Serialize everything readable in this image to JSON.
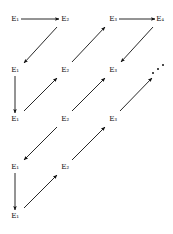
{
  "figure": {
    "type": "commutative-diagram",
    "caption": "",
    "background_color": "#ffffff",
    "ink_color": "#111111",
    "width": 173,
    "height": 234
  },
  "nodes": [
    {
      "id": "n-r1-c1",
      "label": "E₁",
      "row": 1,
      "col": 1,
      "x": 15,
      "y": 19
    },
    {
      "id": "n-r1-c2",
      "label": "E₂",
      "row": 1,
      "col": 2,
      "x": 65,
      "y": 19
    },
    {
      "id": "n-r1-c3",
      "label": "E₃",
      "row": 1,
      "col": 3,
      "x": 113,
      "y": 19
    },
    {
      "id": "n-r1-c4",
      "label": "E₄",
      "row": 1,
      "col": 4,
      "x": 160,
      "y": 19
    },
    {
      "id": "n-r2-c1",
      "label": "E₁",
      "row": 2,
      "col": 1,
      "x": 15,
      "y": 70
    },
    {
      "id": "n-r2-c2",
      "label": "E₂",
      "row": 2,
      "col": 2,
      "x": 65,
      "y": 70
    },
    {
      "id": "n-r2-c3",
      "label": "E₃",
      "row": 2,
      "col": 3,
      "x": 113,
      "y": 70
    },
    {
      "id": "n-r3-c1",
      "label": "E₁",
      "row": 3,
      "col": 1,
      "x": 15,
      "y": 119
    },
    {
      "id": "n-r3-c2",
      "label": "E₂",
      "row": 3,
      "col": 2,
      "x": 65,
      "y": 119
    },
    {
      "id": "n-r3-c3",
      "label": "E₃",
      "row": 3,
      "col": 3,
      "x": 113,
      "y": 119
    },
    {
      "id": "n-r4-c1",
      "label": "E₁",
      "row": 4,
      "col": 1,
      "x": 15,
      "y": 167
    },
    {
      "id": "n-r4-c2",
      "label": "E₂",
      "row": 4,
      "col": 2,
      "x": 65,
      "y": 167
    },
    {
      "id": "n-r5-c1",
      "label": "E₁",
      "row": 5,
      "col": 1,
      "x": 15,
      "y": 216
    }
  ],
  "arrows": [
    {
      "id": "a-h-r1-c1-c2",
      "kind": "horizontal",
      "from": "n-r1-c1",
      "to": "n-r1-c2",
      "x1": 21,
      "y1": 19,
      "x2": 59,
      "y2": 19,
      "label": ""
    },
    {
      "id": "a-h-r1-c3-c4",
      "kind": "horizontal",
      "from": "n-r1-c3",
      "to": "n-r1-c4",
      "x1": 119,
      "y1": 19,
      "x2": 155,
      "y2": 19,
      "label": ""
    },
    {
      "id": "a-v-c1-r2-r3",
      "kind": "vertical",
      "from": "n-r2-c1",
      "to": "n-r3-c1",
      "x1": 15,
      "y1": 76,
      "x2": 15,
      "y2": 113,
      "label": ""
    },
    {
      "id": "a-v-c1-r4-r5",
      "kind": "vertical",
      "from": "n-r4-c1",
      "to": "n-r5-c1",
      "x1": 15,
      "y1": 173,
      "x2": 15,
      "y2": 210,
      "label": ""
    },
    {
      "id": "a-d-r1c2-to-r2c1",
      "kind": "diagonal-down-left",
      "from": "n-r1-c2",
      "to": "n-r2-c1",
      "x1": 57,
      "y1": 27,
      "x2": 24,
      "y2": 63,
      "label": ""
    },
    {
      "id": "a-d-r2c2-to-r1c3",
      "kind": "diagonal-up-right",
      "from": "n-r2-c2",
      "to": "n-r1-c3",
      "x1": 72,
      "y1": 62,
      "x2": 105,
      "y2": 27,
      "label": ""
    },
    {
      "id": "a-d-r1c4-to-r2c3",
      "kind": "diagonal-down-left",
      "from": "n-r1-c4",
      "to": "n-r2-c3",
      "x1": 153,
      "y1": 27,
      "x2": 121,
      "y2": 62,
      "label": ""
    },
    {
      "id": "a-d-r3c1-to-r2c2",
      "kind": "diagonal-up-right",
      "from": "n-r3-c1",
      "to": "n-r2-c2",
      "x1": 24,
      "y1": 111,
      "x2": 57,
      "y2": 78,
      "label": ""
    },
    {
      "id": "a-d-r3c2-to-r2c3",
      "kind": "diagonal-up-right",
      "from": "n-r3-c2",
      "to": "n-r2-c3",
      "x1": 72,
      "y1": 111,
      "x2": 105,
      "y2": 78,
      "label": ""
    },
    {
      "id": "a-d-r3c3-to-ellipsis",
      "kind": "diagonal-up-right",
      "from": "n-r3-c3",
      "to": "ellipsis-top-right",
      "x1": 120,
      "y1": 111,
      "x2": 152,
      "y2": 78,
      "label": ""
    },
    {
      "id": "a-d-r3c2-to-r4c1",
      "kind": "diagonal-down-left",
      "from": "n-r3-c2",
      "to": "n-r4-c1",
      "x1": 57,
      "y1": 127,
      "x2": 24,
      "y2": 160,
      "label": ""
    },
    {
      "id": "a-d-r4c2-to-r3c3",
      "kind": "diagonal-up-right",
      "from": "n-r4-c2",
      "to": "n-r3-c3",
      "x1": 72,
      "y1": 160,
      "x2": 105,
      "y2": 127,
      "label": ""
    },
    {
      "id": "a-d-r5c1-to-r4c2",
      "kind": "diagonal-up-right",
      "from": "n-r5-c1",
      "to": "n-r4-c2",
      "x1": 24,
      "y1": 208,
      "x2": 57,
      "y2": 175,
      "label": ""
    }
  ],
  "ellipsis": [
    {
      "id": "ellipsis-top-right",
      "glyph": "⋰",
      "x": 159,
      "y": 69,
      "dots": 3
    }
  ]
}
